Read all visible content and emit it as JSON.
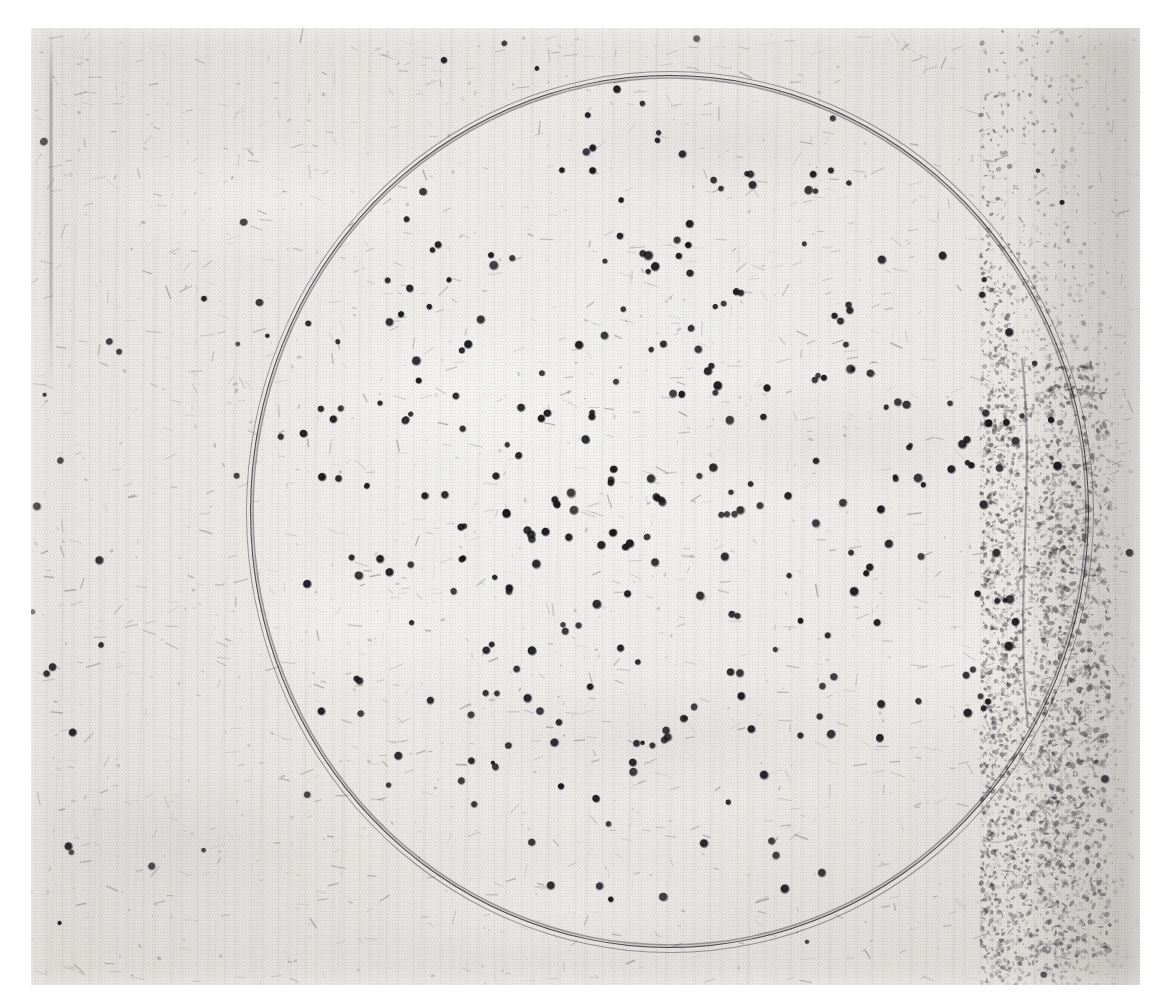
{
  "page": {
    "background_color": "#ffffff",
    "width": 1163,
    "height": 1008,
    "cut_caption_text": "",
    "figure_kind": "halftone-printed photograph"
  },
  "photo": {
    "x": 31,
    "y": 28,
    "width": 1109,
    "height": 957,
    "subject": "circular settle plate with dark bacterial colonies on a textured plaster surface",
    "base_color": "#ecebe7",
    "ink_color": "#1e1e20",
    "right_margin_band": "darker mottled speckled strip along right edge",
    "background_texture": "vertical brush / grain streaks with plaster mottling"
  },
  "plate": {
    "center_x": 670,
    "center_y": 512,
    "radius_x": 420,
    "radius_y": 437,
    "rim_color": "#1e1e20",
    "rim_style": "thin dark double ring, uneven ink weight",
    "interior_tone": "#f2f1ee"
  },
  "chart_data": {
    "type": "scatter",
    "title": "",
    "xlabel": "",
    "ylabel": "",
    "units": "pixels (image coordinates)",
    "xlim": [
      31,
      1140
    ],
    "ylim": [
      28,
      985
    ],
    "grid": false,
    "legend": null,
    "marker": {
      "color": "#16161a",
      "shape": "circle",
      "size_px_range": [
        6,
        11
      ]
    },
    "counts": {
      "inside_plate": 268,
      "outside_plate": 34,
      "total": 302
    },
    "density_profile": {
      "radial_bins_normalized": [
        0.1,
        0.3,
        0.5,
        0.7,
        0.9,
        1.0
      ],
      "relative_density": [
        1.0,
        0.95,
        0.82,
        0.62,
        0.38,
        0.18
      ]
    }
  },
  "generation": {
    "dot_seed": 20250411,
    "debris_seed": 778821,
    "speckle_seed": 451097
  }
}
